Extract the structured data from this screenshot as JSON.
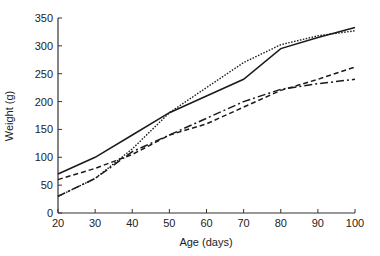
{
  "chart_data": {
    "type": "line",
    "title": "",
    "xlabel": "Age (days)",
    "ylabel": "Weight (g)",
    "xlim": [
      20,
      100
    ],
    "ylim": [
      0,
      350
    ],
    "xticks": [
      20,
      30,
      40,
      50,
      60,
      70,
      80,
      90,
      100
    ],
    "yticks": [
      0,
      50,
      100,
      150,
      200,
      250,
      300,
      350
    ],
    "grid": false,
    "legend": null,
    "x": [
      20,
      30,
      40,
      50,
      60,
      70,
      80,
      90,
      100
    ],
    "series": [
      {
        "name": "solid",
        "style": "solid",
        "values": [
          70,
          100,
          140,
          180,
          210,
          240,
          295,
          315,
          333
        ]
      },
      {
        "name": "dotted",
        "style": "dotted",
        "values": [
          30,
          62,
          115,
          180,
          225,
          270,
          302,
          318,
          327
        ]
      },
      {
        "name": "dashed",
        "style": "dashed",
        "values": [
          60,
          80,
          105,
          140,
          160,
          190,
          220,
          240,
          262
        ]
      },
      {
        "name": "dash-dot",
        "style": "dash-dot",
        "values": [
          30,
          62,
          110,
          140,
          170,
          200,
          222,
          232,
          240
        ]
      }
    ]
  },
  "colors": {
    "line": "#1a1a1a",
    "axis": "#333333",
    "background": "#ffffff"
  }
}
